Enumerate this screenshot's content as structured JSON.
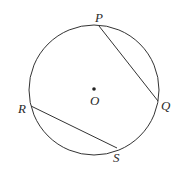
{
  "diagram": {
    "type": "circle-with-chords",
    "circle": {
      "center": {
        "name": "O",
        "x": 94,
        "y": 90
      },
      "radius": 65
    },
    "points": [
      {
        "name": "P",
        "x": 99,
        "y": 26
      },
      {
        "name": "Q",
        "x": 158,
        "y": 101
      },
      {
        "name": "R",
        "x": 31,
        "y": 106
      },
      {
        "name": "S",
        "x": 117,
        "y": 148
      }
    ],
    "chords": [
      [
        "P",
        "Q"
      ],
      [
        "R",
        "S"
      ]
    ],
    "labels": {
      "O": "O",
      "P": "P",
      "Q": "Q",
      "R": "R",
      "S": "S"
    },
    "colors": {
      "stroke": "#333333",
      "text": "#2a2a2a",
      "background": "#ffffff"
    }
  }
}
